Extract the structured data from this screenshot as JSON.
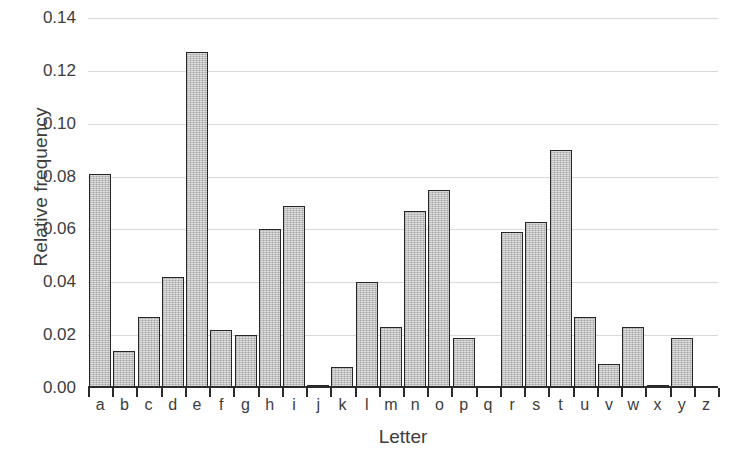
{
  "chart_data": {
    "type": "bar",
    "title": "",
    "xlabel": "Letter",
    "ylabel": "Relative frequency",
    "categories": [
      "a",
      "b",
      "c",
      "d",
      "e",
      "f",
      "g",
      "h",
      "i",
      "j",
      "k",
      "l",
      "m",
      "n",
      "o",
      "p",
      "q",
      "r",
      "s",
      "t",
      "u",
      "v",
      "w",
      "x",
      "y",
      "z"
    ],
    "values": [
      0.081,
      0.014,
      0.027,
      0.042,
      0.127,
      0.022,
      0.02,
      0.06,
      0.069,
      0.001,
      0.008,
      0.04,
      0.023,
      0.067,
      0.075,
      0.019,
      0.0,
      0.059,
      0.063,
      0.09,
      0.027,
      0.009,
      0.023,
      0.001,
      0.019,
      0.0
    ],
    "ylim": [
      0.0,
      0.14
    ],
    "ytick_values": [
      0.0,
      0.02,
      0.04,
      0.06,
      0.08,
      0.1,
      0.12,
      0.14
    ],
    "ytick_labels": [
      "0.00",
      "0.02",
      "0.04",
      "0.06",
      "0.08",
      "0.10",
      "0.12",
      "0.14"
    ],
    "grid": true,
    "grid_axis": "y",
    "legend": false,
    "bar_fill_color": "#b9b9b9",
    "bar_edge_color": "#262626",
    "gridline_color": "#d9d9d9",
    "axis_color": "#2b2b2b",
    "text_color": "#3d3d3d",
    "background_color": "#ffffff"
  }
}
